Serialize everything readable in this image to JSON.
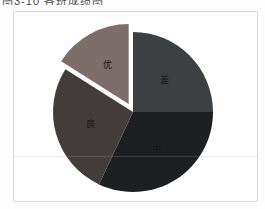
{
  "caption": {
    "text": "图3-10  各班成绩图"
  },
  "panel": {
    "background": "#fefefe",
    "border_color": "#d9d9d9"
  },
  "chart_data": {
    "type": "pie",
    "title": "图3-10 各班成绩图",
    "legend": "none",
    "direction": "clockwise",
    "start_angle_deg": 0,
    "label_color": "#161616",
    "labels": [
      "差",
      "中",
      "良",
      "优"
    ],
    "values": [
      25,
      32,
      27,
      16
    ],
    "slices": [
      {
        "label": "差",
        "value": 25,
        "color": "#3d4042",
        "exploded": false
      },
      {
        "label": "中",
        "value": 32,
        "color": "#1e1f20",
        "exploded": false
      },
      {
        "label": "良",
        "value": 27,
        "color": "#423c3b",
        "exploded": false
      },
      {
        "label": "优",
        "value": 16,
        "color": "#7b6e6b",
        "exploded": true
      }
    ]
  }
}
